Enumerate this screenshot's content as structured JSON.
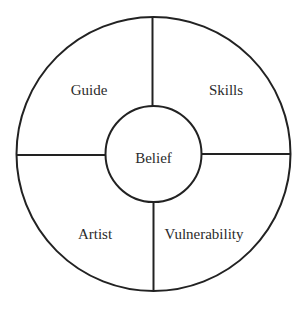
{
  "diagram": {
    "type": "circular-quadrant",
    "center": {
      "label": "Belief"
    },
    "quadrants": [
      {
        "position": "top-left",
        "label": "Guide"
      },
      {
        "position": "top-right",
        "label": "Skills"
      },
      {
        "position": "bottom-left",
        "label": "Artist"
      },
      {
        "position": "bottom-right",
        "label": "Vulnerability"
      }
    ],
    "colors": {
      "stroke": "#222222",
      "text": "#2b2b2b",
      "background": "#ffffff"
    }
  }
}
